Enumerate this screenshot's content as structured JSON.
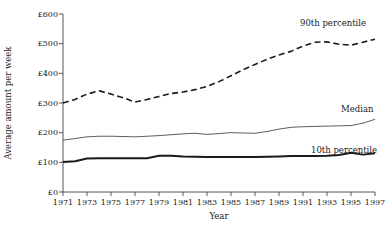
{
  "chart_data": {
    "type": "line",
    "title": "",
    "xlabel": "Year",
    "ylabel": "Average amount per week",
    "xlim": [
      1971,
      1997
    ],
    "ylim": [
      0,
      600
    ],
    "grid": false,
    "legend_position": "inline-right",
    "x": [
      1971,
      1972,
      1973,
      1974,
      1975,
      1976,
      1977,
      1978,
      1979,
      1980,
      1981,
      1982,
      1983,
      1984,
      1985,
      1986,
      1987,
      1988,
      1989,
      1990,
      1991,
      1992,
      1993,
      1994,
      1995,
      1996,
      1997
    ],
    "xtick_labels": [
      "1971",
      "1973",
      "1975",
      "1977",
      "1979",
      "1981",
      "1983",
      "1985",
      "1987",
      "1989",
      "1991",
      "1993",
      "1995",
      "1997"
    ],
    "xtick_values": [
      1971,
      1973,
      1975,
      1977,
      1979,
      1981,
      1983,
      1985,
      1987,
      1989,
      1991,
      1993,
      1995,
      1997
    ],
    "ytick_labels": [
      "£0",
      "£100",
      "£200",
      "£300",
      "£400",
      "£500",
      "£600"
    ],
    "ytick_values": [
      0,
      100,
      200,
      300,
      400,
      500,
      600
    ],
    "series": [
      {
        "name": "90th percentile",
        "label": "90th percentile",
        "style": "dashed",
        "color": "#1a1a1a",
        "width": 1.6,
        "values": [
          300,
          312,
          330,
          341,
          330,
          318,
          303,
          312,
          322,
          332,
          337,
          345,
          356,
          372,
          392,
          412,
          430,
          447,
          462,
          474,
          492,
          505,
          506,
          498,
          495,
          505,
          515
        ]
      },
      {
        "name": "Median",
        "label": "Median",
        "style": "solid",
        "color": "#4d4d4d",
        "width": 0.9,
        "values": [
          175,
          180,
          186,
          188,
          188,
          187,
          186,
          188,
          190,
          193,
          196,
          198,
          194,
          197,
          200,
          199,
          198,
          204,
          212,
          218,
          220,
          221,
          222,
          223,
          224,
          232,
          245
        ]
      },
      {
        "name": "10th percentile",
        "label": "10th percentile",
        "style": "solid",
        "color": "#1a1a1a",
        "width": 2.0,
        "values": [
          101,
          104,
          113,
          114,
          114,
          114,
          114,
          114,
          122,
          122,
          120,
          119,
          118,
          118,
          118,
          118,
          118,
          119,
          120,
          121,
          121,
          121,
          122,
          125,
          132,
          126,
          131
        ]
      }
    ]
  },
  "labels": {
    "ninetieth": "90th percentile",
    "median": "Median",
    "tenth": "10th percentile",
    "xaxis": "Year",
    "yaxis": "Average amount per week"
  },
  "ytick": {
    "t600": "£600",
    "t500": "£500",
    "t400": "£400",
    "t300": "£300",
    "t200": "£200",
    "t100": "£100",
    "t0": "£0"
  },
  "xtick": {
    "t1971": "1971",
    "t1973": "1973",
    "t1975": "1975",
    "t1977": "1977",
    "t1979": "1979",
    "t1981": "1981",
    "t1983": "1983",
    "t1985": "1985",
    "t1987": "1987",
    "t1989": "1989",
    "t1991": "1991",
    "t1993": "1993",
    "t1995": "1995",
    "t1997": "1997"
  },
  "colors": {
    "axis": "#555555",
    "text": "#1a1a1a",
    "ninetieth": "#1a1a1a",
    "median": "#4d4d4d",
    "tenth": "#1a1a1a",
    "background": "#ffffff"
  }
}
